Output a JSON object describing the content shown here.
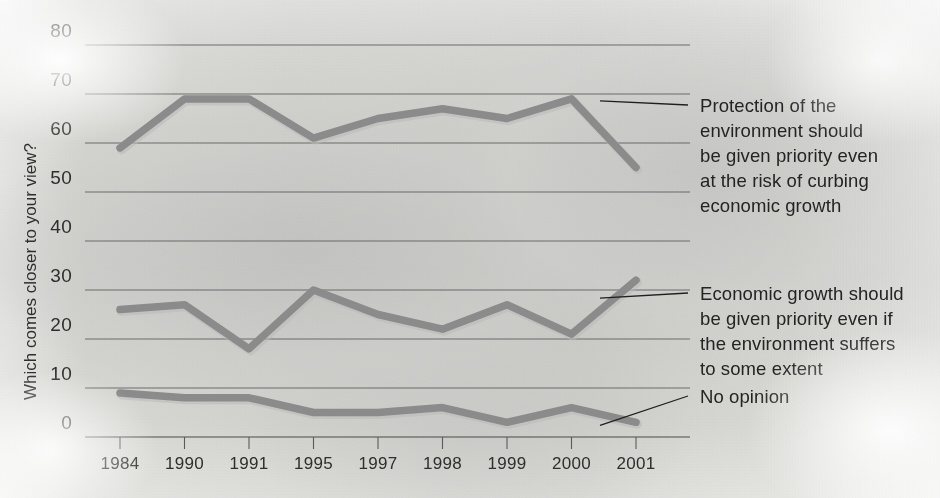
{
  "chart_data": {
    "type": "line",
    "title": "",
    "xlabel": "",
    "ylabel": "Which comes closer to your view?",
    "categories": [
      "1984",
      "1990",
      "1991",
      "1995",
      "1997",
      "1998",
      "1999",
      "2000",
      "2001"
    ],
    "ylim": [
      0,
      80
    ],
    "ytick_step": 10,
    "yticks": [
      "0",
      "10",
      "20",
      "30",
      "40",
      "50",
      "60",
      "70",
      "80"
    ],
    "grid": true,
    "legend_position": "right-annotations",
    "series": [
      {
        "name": "Protection of the environment should be given priority even at the risk of curbing economic growth",
        "values": [
          59,
          69,
          69,
          61,
          65,
          67,
          65,
          69,
          55
        ],
        "color": "#8b8b8b"
      },
      {
        "name": "Economic growth should be given priority even if the environment suffers to some extent",
        "values": [
          26,
          27,
          18,
          30,
          25,
          22,
          27,
          21,
          32
        ],
        "color": "#8b8b8b"
      },
      {
        "name": "No opinion",
        "values": [
          9,
          8,
          8,
          5,
          5,
          6,
          3,
          6,
          3
        ],
        "color": "#8b8b8b"
      }
    ],
    "annotations": [
      {
        "id": "annotation-environment",
        "lines": [
          "Protection of the",
          "environment should",
          "be given priority even",
          "at the risk of curbing",
          "economic growth"
        ],
        "series_index": 0
      },
      {
        "id": "annotation-economy",
        "lines": [
          "Economic growth should",
          "be given priority even if",
          "the environment suffers",
          "to some extent"
        ],
        "series_index": 1
      },
      {
        "id": "annotation-no-opinion",
        "lines": [
          "No opinion"
        ],
        "series_index": 2
      }
    ]
  },
  "axis": {
    "y_title": "Which comes closer to your view?"
  }
}
